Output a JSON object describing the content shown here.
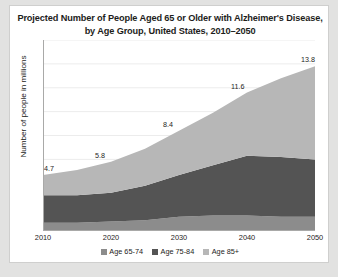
{
  "card": {
    "title": "Projected Number of People Aged 65 or Older with Alzheimer's Disease, by  Age Group, United States, 2010–2050"
  },
  "colors": {
    "series_65_74": "#8c8c8c",
    "series_75_84": "#545454",
    "series_85_plus": "#b7b7b7",
    "page_background": "#e2e2e1",
    "plot_background": "#ffffff",
    "gridline": "#ececec",
    "axis": "#a9a9a8",
    "text": "#1d1d1b"
  },
  "chart_data": {
    "type": "area",
    "stacked": true,
    "title": "Projected Number of People Aged 65 or Older with Alzheimer's Disease, by  Age Group, United States, 2010–2050",
    "xlabel": "",
    "ylabel": "Number of people in millions",
    "x": [
      2010,
      2015,
      2020,
      2025,
      2030,
      2035,
      2040,
      2045,
      2050
    ],
    "tick_labels_x": [
      "2010",
      "2020",
      "2030",
      "2040",
      "2050"
    ],
    "xlim": [
      2010,
      2050
    ],
    "ylim": [
      0,
      16
    ],
    "grid": true,
    "gridlines_y": [
      2,
      4,
      6,
      8,
      10,
      12,
      14,
      16
    ],
    "y_tick_labels_shown": false,
    "legend_position": "bottom",
    "series": [
      {
        "name": "Age 65-74",
        "color": "#8c8c8c",
        "values": [
          0.7,
          0.7,
          0.8,
          0.9,
          1.2,
          1.3,
          1.3,
          1.2,
          1.2
        ]
      },
      {
        "name": "Age 75-84",
        "color": "#545454",
        "values": [
          2.3,
          2.3,
          2.4,
          2.9,
          3.5,
          4.2,
          5.0,
          5.0,
          4.8
        ]
      },
      {
        "name": "Age 85+",
        "color": "#b7b7b7",
        "values": [
          1.7,
          2.1,
          2.6,
          3.1,
          3.7,
          4.4,
          5.3,
          6.6,
          7.8
        ]
      }
    ],
    "totals": [
      4.7,
      5.1,
      5.8,
      6.9,
      8.4,
      9.9,
      11.6,
      12.8,
      13.8
    ],
    "data_labels": [
      {
        "x": 2010,
        "value": 4.7,
        "label": "4.7"
      },
      {
        "x": 2020,
        "value": 5.8,
        "label": "5.8"
      },
      {
        "x": 2030,
        "value": 8.4,
        "label": "8.4"
      },
      {
        "x": 2040,
        "value": 11.6,
        "label": "11.6"
      },
      {
        "x": 2050,
        "value": 13.8,
        "label": "13.8"
      }
    ]
  },
  "legend": {
    "items": [
      {
        "label": "Age 65-74",
        "color": "#8c8c8c"
      },
      {
        "label": "Age 75-84",
        "color": "#545454"
      },
      {
        "label": "Age 85+",
        "color": "#b7b7b7"
      }
    ]
  }
}
